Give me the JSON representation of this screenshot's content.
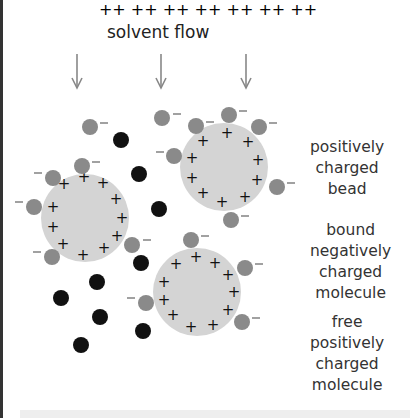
{
  "title": "solvent flow",
  "labels": {
    "bead": [
      "positively",
      "charged",
      "bead"
    ],
    "bound": [
      "bound",
      "negatively",
      "charged",
      "molecule"
    ],
    "free": [
      "free",
      "positively",
      "charged",
      "molecule"
    ]
  },
  "signs": {
    "plus": "+",
    "minus": "−"
  },
  "colors": {
    "bead": "#d4d4d4",
    "negative_molecule": "#8a8a8a",
    "positive_molecule": "#111111",
    "arrow": "#888888",
    "text": "#333333"
  },
  "arrows_x": [
    77,
    161,
    246
  ],
  "beads": [
    {
      "cx": 224,
      "cy": 167,
      "r": 44
    },
    {
      "cx": 85,
      "cy": 218,
      "r": 44
    },
    {
      "cx": 197,
      "cy": 292,
      "r": 44
    }
  ]
}
